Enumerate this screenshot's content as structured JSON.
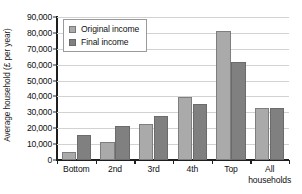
{
  "chart_data": {
    "type": "bar",
    "title": "",
    "xlabel": "",
    "ylabel": "Average household (£ per year)",
    "ylim": [
      0,
      90000
    ],
    "ytick_labels": [
      "0",
      "10,000",
      "20,000",
      "30,000",
      "40,000",
      "50,000",
      "60,000",
      "70,000",
      "80,000",
      "90,000"
    ],
    "ytick_values": [
      0,
      10000,
      20000,
      30000,
      40000,
      50000,
      60000,
      70000,
      80000,
      90000
    ],
    "grid": true,
    "grid_axis": "y",
    "legend_position": "top-left-inside",
    "categories": [
      "Bottom",
      "2nd",
      "3rd",
      "4th",
      "Top",
      "All\nhouseholds"
    ],
    "series": [
      {
        "name": "Original income",
        "color": "#aaaaaa",
        "values": [
          5000,
          11500,
          22500,
          39500,
          81000,
          32500
        ]
      },
      {
        "name": "Final income",
        "color": "#808080",
        "values": [
          15500,
          21500,
          27500,
          35500,
          61500,
          32500
        ]
      }
    ]
  }
}
